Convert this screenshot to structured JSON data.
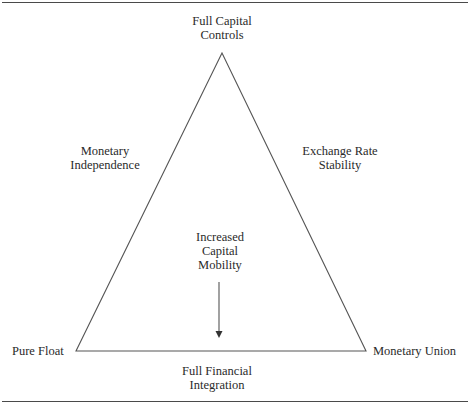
{
  "diagram": {
    "type": "impossible-trinity-triangle",
    "vertices": {
      "top": {
        "label_lines": [
          "Full Capital",
          "Controls"
        ]
      },
      "bottom_left": {
        "label_lines": [
          "Pure Float"
        ]
      },
      "bottom_right": {
        "label_lines": [
          "Monetary Union"
        ]
      }
    },
    "sides": {
      "left": {
        "label_lines": [
          "Monetary",
          "Independence"
        ]
      },
      "right": {
        "label_lines": [
          "Exchange Rate",
          "Stability"
        ]
      },
      "bottom": {
        "label_lines": [
          "Full Financial",
          "Integration"
        ]
      }
    },
    "center": {
      "label_lines": [
        "Increased",
        "Capital",
        "Mobility"
      ],
      "arrow_direction": "down"
    },
    "colors": {
      "line": "#555555",
      "text": "#2a2a2a",
      "background": "#ffffff"
    }
  }
}
